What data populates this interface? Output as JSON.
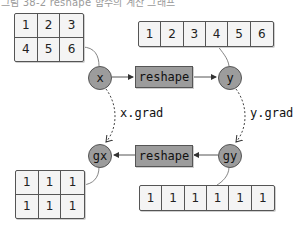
{
  "caption": "그림 38-2 reshape 함수의 계산 그래프",
  "forward": {
    "input_node": "x",
    "function": "reshape",
    "output_node": "y",
    "x_values": [
      [
        "1",
        "2",
        "3"
      ],
      [
        "4",
        "5",
        "6"
      ]
    ],
    "y_values": [
      "1",
      "2",
      "3",
      "4",
      "5",
      "6"
    ]
  },
  "backward": {
    "input_node": "gy",
    "function": "reshape",
    "output_node": "gx",
    "gx_values": [
      [
        "1",
        "1",
        "1"
      ],
      [
        "1",
        "1",
        "1"
      ]
    ],
    "gy_values": [
      "1",
      "1",
      "1",
      "1",
      "1",
      "1"
    ]
  },
  "links": {
    "x_to_gx": "x.grad",
    "y_to_gy": "y.grad"
  },
  "colors": {
    "node_fill": "#9c9c9c",
    "stroke": "#555555",
    "cell_fill": "#f4f4f4"
  }
}
